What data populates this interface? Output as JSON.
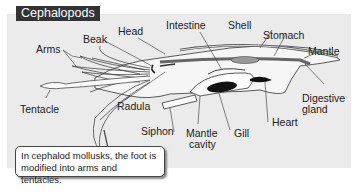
{
  "title": "Cephalopods",
  "labels": {
    "arms": "Arms",
    "beak": "Beak",
    "head": "Head",
    "intestine": "Intestine",
    "shell": "Shell",
    "stomach": "Stomach",
    "mantle": "Mantle",
    "digestive_gland_1": "Digestive",
    "digestive_gland_2": "gland",
    "tentacle": "Tentacle",
    "radula": "Radula",
    "siphon": "Siphon",
    "mantle_cavity_1": "Mantle",
    "mantle_cavity_2": "cavity",
    "gill": "Gill",
    "heart": "Heart"
  },
  "callout": "In cephalod mollusks, the foot is modified into arms and tentacles.",
  "colors": {
    "background": "#ebebeb",
    "title_bg": "#333333",
    "title_text": "#ffffff",
    "gill": "#111111"
  }
}
